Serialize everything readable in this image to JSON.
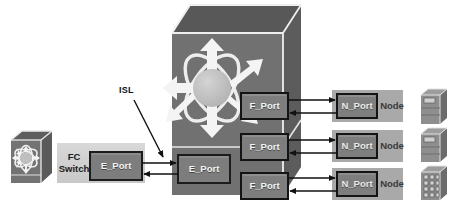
{
  "diagram": {
    "canvas": {
      "width": 461,
      "height": 213,
      "background": "#ffffff"
    }
  },
  "colors": {
    "device_face": "#6f6f6f",
    "device_top": "#565656",
    "device_side": "#5a5a5a",
    "port_box_fill": "#7d7d7d",
    "port_box_stroke": "#1c1c1c",
    "node_bar_fill": "#a8a8a8",
    "fc_switch_band": "#cfcfcf",
    "server_fill": "#8d8d8d",
    "server_side": "#6a6a6a",
    "server_top": "#9c9c9c",
    "accent_white": "#f4f4f4",
    "line": "#111111",
    "sphere": "#bdbdbd",
    "text_dark": "#1a1a1a",
    "text_light": "#f2f2f2"
  },
  "annotations": {
    "isl": {
      "label": "ISL",
      "x": 120,
      "y": 88
    }
  },
  "fc_switch": {
    "label_line1": "FC",
    "label_line2": "Switch",
    "icon_name": "fc-switch-cube-icon",
    "band": {
      "x": 57,
      "y": 143,
      "w": 88,
      "h": 40
    },
    "port": {
      "label": "E_Port",
      "x": 90,
      "y": 152,
      "w": 52,
      "h": 28
    }
  },
  "director": {
    "icon_name": "director-cube-icon",
    "front": {
      "x": 172,
      "y": 33,
      "w": 111,
      "h": 162
    },
    "e_port": {
      "label": "E_Port",
      "x": 178,
      "y": 155,
      "w": 52,
      "h": 28
    },
    "f_ports": [
      {
        "label": "F_Port",
        "x": 241,
        "y": 93,
        "w": 47,
        "h": 26
      },
      {
        "label": "F_Port",
        "x": 241,
        "y": 134,
        "w": 47,
        "h": 26
      },
      {
        "label": "F_Port",
        "x": 241,
        "y": 173,
        "w": 47,
        "h": 26
      }
    ]
  },
  "nodes": [
    {
      "bar_label": "Node",
      "port_label": "N_Port",
      "bar": {
        "x": 332,
        "y": 90,
        "w": 71,
        "h": 32
      },
      "port": {
        "x": 337,
        "y": 94,
        "w": 40,
        "h": 24
      },
      "server_icon": "tower-server-icon"
    },
    {
      "bar_label": "Node",
      "port_label": "N_Port",
      "bar": {
        "x": 332,
        "y": 130,
        "w": 71,
        "h": 32
      },
      "port": {
        "x": 337,
        "y": 134,
        "w": 40,
        "h": 24
      },
      "server_icon": "tower-server-icon"
    },
    {
      "bar_label": "Node",
      "port_label": "N_Port",
      "bar": {
        "x": 332,
        "y": 168,
        "w": 71,
        "h": 32
      },
      "port": {
        "x": 337,
        "y": 172,
        "w": 40,
        "h": 24
      },
      "server_icon": "disk-array-icon"
    }
  ],
  "links": [
    {
      "name": "isl-link-outbound",
      "from": "fc-switch-e-port",
      "to": "director-e-port",
      "direction": "right"
    },
    {
      "name": "isl-link-inbound",
      "from": "director-e-port",
      "to": "fc-switch-e-port",
      "direction": "left"
    },
    {
      "name": "f-port-1-out",
      "from": "director-f-port-1",
      "to": "node-1-n-port",
      "direction": "right"
    },
    {
      "name": "n-port-1-in",
      "from": "node-1-n-port",
      "to": "director-f-port-1",
      "direction": "left"
    },
    {
      "name": "f-port-2-out",
      "from": "director-f-port-2",
      "to": "node-2-n-port",
      "direction": "right"
    },
    {
      "name": "n-port-2-in",
      "from": "node-2-n-port",
      "to": "director-f-port-2",
      "direction": "left"
    },
    {
      "name": "f-port-3-out",
      "from": "director-f-port-3",
      "to": "node-3-n-port",
      "direction": "right"
    },
    {
      "name": "n-port-3-in",
      "from": "node-3-n-port",
      "to": "director-f-port-3",
      "direction": "left"
    }
  ]
}
